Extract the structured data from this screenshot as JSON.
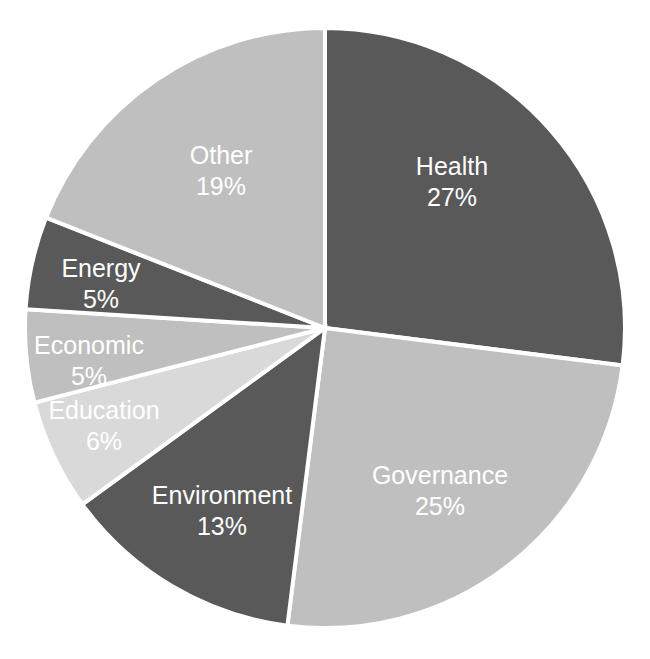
{
  "chart_data": {
    "type": "pie",
    "title": "",
    "xlabel": "",
    "ylabel": "",
    "legend_position": "none",
    "labels_inside_slices": true,
    "start_angle_deg": 0,
    "direction": "clockwise",
    "background_color": "#FFFFFF",
    "separator_color": "#FFFFFF",
    "label_text_color": "#FFFFFF",
    "categories": [
      "Health",
      "Governance",
      "Environment",
      "Education",
      "Economic",
      "Energy",
      "Other"
    ],
    "values": [
      27,
      25,
      13,
      6,
      5,
      5,
      19
    ],
    "value_unit": "%",
    "total": 100,
    "slices": [
      {
        "label": "Health",
        "value": 27,
        "value_text": "27%",
        "color": "#595959"
      },
      {
        "label": "Governance",
        "value": 25,
        "value_text": "25%",
        "color": "#BFBFBF"
      },
      {
        "label": "Environment",
        "value": 13,
        "value_text": "13%",
        "color": "#595959"
      },
      {
        "label": "Education",
        "value": 6,
        "value_text": "6%",
        "color": "#D9D9D9"
      },
      {
        "label": "Economic",
        "value": 5,
        "value_text": "5%",
        "color": "#BFBFBF"
      },
      {
        "label": "Energy",
        "value": 5,
        "value_text": "5%",
        "color": "#595959"
      },
      {
        "label": "Other",
        "value": 19,
        "value_text": "19%",
        "color": "#BFBFBF"
      }
    ],
    "geometry": {
      "center_x": 325,
      "center_y": 328,
      "radius": 300
    },
    "label_positions": [
      {
        "label": "Health",
        "x": 452,
        "y": 168
      },
      {
        "label": "Governance",
        "x": 440,
        "y": 477
      },
      {
        "label": "Environment",
        "x": 222,
        "y": 497
      },
      {
        "label": "Education",
        "x": 104,
        "y": 412
      },
      {
        "label": "Economic",
        "x": 89,
        "y": 347
      },
      {
        "label": "Energy",
        "x": 101,
        "y": 270
      },
      {
        "label": "Other",
        "x": 221,
        "y": 157
      }
    ]
  }
}
